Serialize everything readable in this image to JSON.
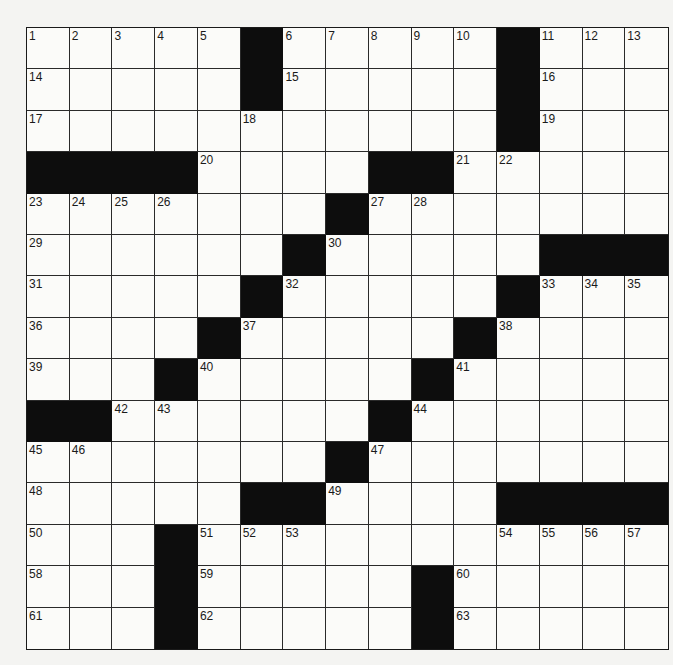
{
  "puzzle": {
    "rows": 15,
    "cols": 15,
    "colors": {
      "block": "#0d0d0d",
      "cell": "#fbfbf9",
      "line": "#2a2a2a"
    },
    "pattern": [
      "00000100000100 0",
      "placeholder"
    ],
    "grid": [
      [
        0,
        0,
        0,
        0,
        0,
        1,
        0,
        0,
        0,
        0,
        0,
        1,
        0,
        0,
        0
      ],
      [
        0,
        0,
        0,
        0,
        0,
        1,
        0,
        0,
        0,
        0,
        0,
        1,
        0,
        0,
        0
      ],
      [
        0,
        0,
        0,
        0,
        0,
        0,
        0,
        0,
        0,
        0,
        0,
        1,
        0,
        0,
        0
      ],
      [
        1,
        1,
        1,
        1,
        0,
        0,
        0,
        0,
        1,
        1,
        0,
        0,
        0,
        0,
        0
      ],
      [
        0,
        0,
        0,
        0,
        0,
        0,
        0,
        1,
        0,
        0,
        0,
        0,
        0,
        0,
        0
      ],
      [
        0,
        0,
        0,
        0,
        0,
        0,
        1,
        0,
        0,
        0,
        0,
        0,
        1,
        1,
        1
      ],
      [
        0,
        0,
        0,
        0,
        0,
        1,
        0,
        0,
        0,
        0,
        0,
        1,
        0,
        0,
        0
      ],
      [
        0,
        0,
        0,
        0,
        1,
        0,
        0,
        0,
        0,
        0,
        1,
        0,
        0,
        0,
        0
      ],
      [
        0,
        0,
        0,
        1,
        0,
        0,
        0,
        0,
        0,
        1,
        0,
        0,
        0,
        0,
        0
      ],
      [
        1,
        1,
        0,
        0,
        0,
        0,
        0,
        0,
        1,
        0,
        0,
        0,
        0,
        0,
        0
      ],
      [
        0,
        0,
        0,
        0,
        0,
        0,
        0,
        1,
        0,
        0,
        0,
        0,
        0,
        0,
        0
      ],
      [
        0,
        0,
        0,
        0,
        0,
        1,
        1,
        0,
        0,
        0,
        0,
        1,
        1,
        1,
        1
      ],
      [
        0,
        0,
        0,
        1,
        0,
        0,
        0,
        0,
        0,
        0,
        0,
        0,
        0,
        0,
        0
      ],
      [
        0,
        0,
        0,
        1,
        0,
        0,
        0,
        0,
        0,
        1,
        0,
        0,
        0,
        0,
        0
      ],
      [
        0,
        0,
        0,
        1,
        0,
        0,
        0,
        0,
        0,
        1,
        0,
        0,
        0,
        0,
        0
      ]
    ],
    "numbers": [
      [
        0,
        0,
        "1"
      ],
      [
        0,
        1,
        "2"
      ],
      [
        0,
        2,
        "3"
      ],
      [
        0,
        3,
        "4"
      ],
      [
        0,
        4,
        "5"
      ],
      [
        0,
        6,
        "6"
      ],
      [
        0,
        7,
        "7"
      ],
      [
        0,
        8,
        "8"
      ],
      [
        0,
        9,
        "9"
      ],
      [
        0,
        10,
        "10"
      ],
      [
        0,
        12,
        "11"
      ],
      [
        0,
        13,
        "12"
      ],
      [
        0,
        14,
        "13"
      ],
      [
        1,
        0,
        "14"
      ],
      [
        1,
        6,
        "15"
      ],
      [
        1,
        12,
        "16"
      ],
      [
        2,
        0,
        "17"
      ],
      [
        2,
        5,
        "18"
      ],
      [
        2,
        12,
        "19"
      ],
      [
        3,
        4,
        "20"
      ],
      [
        3,
        10,
        "21"
      ],
      [
        3,
        11,
        "22"
      ],
      [
        4,
        0,
        "23"
      ],
      [
        4,
        1,
        "24"
      ],
      [
        4,
        2,
        "25"
      ],
      [
        4,
        3,
        "26"
      ],
      [
        4,
        8,
        "27"
      ],
      [
        4,
        9,
        "28"
      ],
      [
        5,
        0,
        "29"
      ],
      [
        5,
        7,
        "30"
      ],
      [
        6,
        0,
        "31"
      ],
      [
        6,
        6,
        "32"
      ],
      [
        6,
        12,
        "33"
      ],
      [
        6,
        13,
        "34"
      ],
      [
        6,
        14,
        "35"
      ],
      [
        7,
        0,
        "36"
      ],
      [
        7,
        5,
        "37"
      ],
      [
        7,
        11,
        "38"
      ],
      [
        8,
        0,
        "39"
      ],
      [
        8,
        4,
        "40"
      ],
      [
        8,
        10,
        "41"
      ],
      [
        9,
        2,
        "42"
      ],
      [
        9,
        3,
        "43"
      ],
      [
        9,
        9,
        "44"
      ],
      [
        10,
        0,
        "45"
      ],
      [
        10,
        1,
        "46"
      ],
      [
        10,
        8,
        "47"
      ],
      [
        11,
        0,
        "48"
      ],
      [
        11,
        7,
        "49"
      ],
      [
        12,
        0,
        "50"
      ],
      [
        12,
        4,
        "51"
      ],
      [
        12,
        5,
        "52"
      ],
      [
        12,
        6,
        "53"
      ],
      [
        12,
        11,
        "54"
      ],
      [
        12,
        12,
        "55"
      ],
      [
        12,
        13,
        "56"
      ],
      [
        12,
        14,
        "57"
      ],
      [
        13,
        0,
        "58"
      ],
      [
        13,
        4,
        "59"
      ],
      [
        13,
        10,
        "60"
      ],
      [
        14,
        0,
        "61"
      ],
      [
        14,
        4,
        "62"
      ],
      [
        14,
        10,
        "63"
      ]
    ]
  }
}
